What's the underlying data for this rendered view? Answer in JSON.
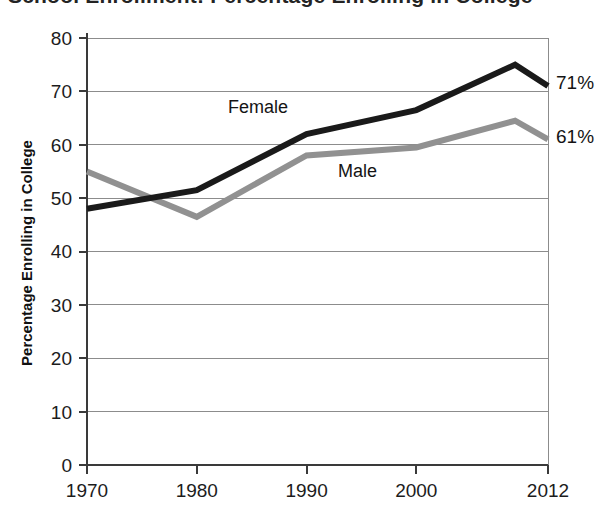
{
  "title": {
    "text": "School Enrollment: Percentage Enrolling in College",
    "cropped": true
  },
  "chart_data": {
    "type": "line",
    "title": "School Enrollment: Percentage Enrolling in College",
    "xlabel": "",
    "ylabel": "Percentage Enrolling in College",
    "x": [
      1970,
      1980,
      1990,
      2000,
      2009,
      2012
    ],
    "xlim": [
      1970,
      2012
    ],
    "ylim": [
      0,
      80
    ],
    "ytick_labels": [
      "0",
      "10",
      "20",
      "30",
      "40",
      "50",
      "60",
      "70",
      "80"
    ],
    "yticks": [
      0,
      10,
      20,
      30,
      40,
      50,
      60,
      70,
      80
    ],
    "xtick_labels": [
      "1970",
      "1980",
      "1990",
      "2000",
      "2012"
    ],
    "xticks": [
      1970,
      1980,
      1990,
      2000,
      2012
    ],
    "grid": "horizontal",
    "legend": "inline-labels",
    "series": [
      {
        "name": "Female",
        "color": "#1a1a1a",
        "values": [
          48,
          51.5,
          62,
          66.5,
          75,
          71
        ],
        "end_label": "71%"
      },
      {
        "name": "Male",
        "color": "#919191",
        "values": [
          55,
          46.5,
          58,
          59.5,
          64.5,
          61
        ],
        "end_label": "61%"
      }
    ],
    "annotations": [
      {
        "text": "Female",
        "x": 1986.5,
        "y": 69.5
      },
      {
        "text": "Male",
        "x": 1993.5,
        "y": 56.2
      },
      {
        "text": "71%",
        "x": 2012,
        "y": 71
      },
      {
        "text": "61%",
        "x": 2012,
        "y": 61
      }
    ]
  },
  "axes": {
    "y_title": "Percentage Enrolling in College",
    "y_ticks": [
      "80",
      "70",
      "60",
      "50",
      "40",
      "30",
      "20",
      "10",
      "0"
    ],
    "x_ticks": [
      "1970",
      "1980",
      "1990",
      "2000",
      "2012"
    ]
  },
  "colors": {
    "female_line": "#1a1a1a",
    "male_line": "#919191",
    "gridline": "#8c8c8c",
    "axis": "#3a3a3a",
    "background": "#ffffff"
  }
}
